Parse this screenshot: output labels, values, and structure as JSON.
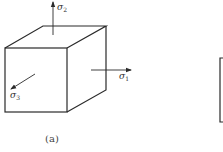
{
  "figure": {
    "panel_a": {
      "caption": "(a)",
      "shape": "cube",
      "labels": {
        "sigma1": {
          "symbol": "σ",
          "subscript": "1",
          "direction": "right"
        },
        "sigma2": {
          "symbol": "σ",
          "subscript": "2",
          "direction": "up"
        },
        "sigma3": {
          "symbol": "σ",
          "subscript": "3",
          "direction": "front-left"
        }
      }
    },
    "panel_b": {
      "shape": "partially visible box"
    },
    "colors": {
      "line": "#2a2a2a",
      "background": "#ffffff"
    }
  }
}
